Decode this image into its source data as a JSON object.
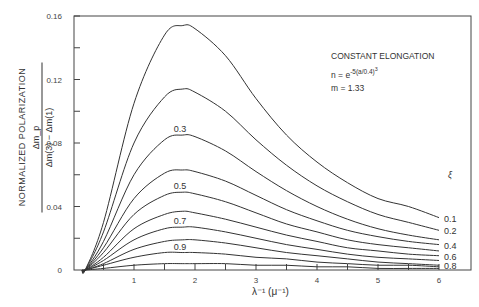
{
  "chart_data": {
    "type": "line",
    "title": "",
    "xlabel": "λ⁻¹ (μ⁻¹)",
    "ylabel": "NORMALIZED POLARIZATION  Δm_p / (Δm(3) − Δm(1))",
    "ylabel_main": "NORMALIZED POLARIZATION",
    "ylabel_num": "Δm_p",
    "ylabel_den": "Δm(3) − Δm(1)",
    "xlim": [
      0,
      6.5
    ],
    "ylim": [
      0,
      0.16
    ],
    "xticks": [
      "1",
      "2",
      "3",
      "4",
      "5",
      "6"
    ],
    "yticks": [
      "0",
      "0.04",
      "0.08",
      "0.12",
      "0.16"
    ],
    "grid": false,
    "annotations": [
      "CONSTANT ELONGATION",
      "n = e^{-5(a/0.4)^3}",
      "m = 1.33"
    ],
    "legend_title": "ξ",
    "legend_position": "right edge (curve end labels)",
    "x": [
      0.2,
      0.5,
      1.0,
      1.5,
      1.8,
      2.0,
      2.5,
      3.0,
      3.5,
      4.0,
      4.5,
      5.0,
      5.5,
      6.0
    ],
    "series": [
      {
        "name": "0.1",
        "values": [
          0.0,
          0.03,
          0.105,
          0.148,
          0.154,
          0.152,
          0.135,
          0.108,
          0.085,
          0.068,
          0.055,
          0.045,
          0.04,
          0.033
        ]
      },
      {
        "name": "0.2",
        "values": [
          0.0,
          0.024,
          0.08,
          0.109,
          0.114,
          0.112,
          0.1,
          0.082,
          0.066,
          0.053,
          0.043,
          0.035,
          0.03,
          0.025
        ]
      },
      {
        "name": "0.3",
        "values": [
          0.0,
          0.018,
          0.06,
          0.082,
          0.085,
          0.084,
          0.075,
          0.062,
          0.05,
          0.04,
          0.032,
          0.026,
          0.022,
          0.019
        ]
      },
      {
        "name": "0.4",
        "values": [
          0.0,
          0.014,
          0.045,
          0.061,
          0.063,
          0.062,
          0.056,
          0.047,
          0.038,
          0.031,
          0.025,
          0.021,
          0.018,
          0.016
        ]
      },
      {
        "name": "0.5",
        "values": [
          0.0,
          0.011,
          0.035,
          0.047,
          0.049,
          0.048,
          0.043,
          0.036,
          0.029,
          0.024,
          0.019,
          0.016,
          0.014,
          0.012
        ]
      },
      {
        "name": "0.6",
        "values": [
          0.0,
          0.008,
          0.026,
          0.035,
          0.037,
          0.036,
          0.032,
          0.027,
          0.022,
          0.018,
          0.014,
          0.012,
          0.01,
          0.009
        ]
      },
      {
        "name": "0.7",
        "values": [
          0.0,
          0.006,
          0.019,
          0.026,
          0.027,
          0.027,
          0.024,
          0.02,
          0.016,
          0.013,
          0.01,
          0.008,
          0.007,
          0.006
        ]
      },
      {
        "name": "0.8",
        "values": [
          0.0,
          0.004,
          0.013,
          0.018,
          0.019,
          0.019,
          0.017,
          0.014,
          0.011,
          0.009,
          0.007,
          0.005,
          0.004,
          0.003
        ]
      },
      {
        "name": "0.9",
        "values": [
          0.0,
          0.003,
          0.008,
          0.011,
          0.011,
          0.011,
          0.01,
          0.008,
          0.007,
          0.005,
          0.004,
          0.003,
          0.003,
          0.002
        ]
      },
      {
        "name": "1.0",
        "values": [
          0.0,
          0.001,
          0.003,
          0.004,
          0.004,
          0.004,
          0.004,
          0.003,
          0.003,
          0.002,
          0.002,
          0.001,
          0.001,
          0.001
        ]
      }
    ],
    "inline_labels": [
      "0.3",
      "0.5",
      "0.7",
      "0.9"
    ],
    "end_labels": [
      "0.1",
      "0.2",
      "0.4",
      "0.6",
      "0.8"
    ]
  },
  "colors": {
    "line": "#333333",
    "background": "#ffffff"
  }
}
